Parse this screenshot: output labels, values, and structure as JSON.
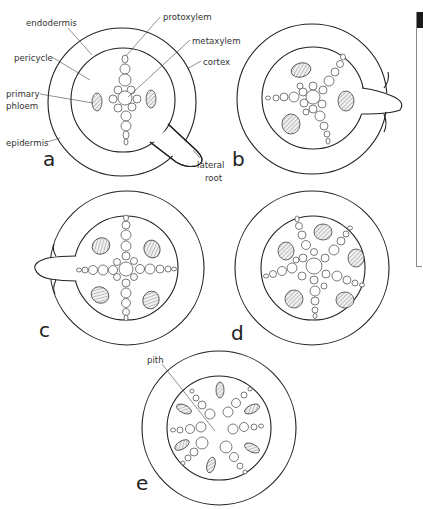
{
  "figure": {
    "panels": [
      {
        "id": "a",
        "letter": "a",
        "arrangement": "diarch",
        "lateral_root": "bottom-right"
      },
      {
        "id": "b",
        "letter": "b",
        "arrangement": "triarch",
        "lateral_root": "right"
      },
      {
        "id": "c",
        "letter": "c",
        "arrangement": "tetrarch",
        "lateral_root": "left"
      },
      {
        "id": "d",
        "letter": "d",
        "arrangement": "pentarch",
        "lateral_root": "none"
      },
      {
        "id": "e",
        "letter": "e",
        "arrangement": "polyarch with pith",
        "lateral_root": "none"
      }
    ],
    "labels": {
      "endodermis": "endodermis",
      "pericycle": "pericycle",
      "primary_phloem_1": "primary",
      "primary_phloem_2": "phloem",
      "epidermis": "epidermis",
      "protoxylem": "protoxylem",
      "metaxylem": "metaxylem",
      "cortex": "cortex",
      "lateral_root_1": "lateral",
      "lateral_root_2": "root",
      "pith": "pith"
    },
    "colors": {
      "line": "#222222",
      "text": "#333333",
      "background": "#ffffff"
    }
  }
}
